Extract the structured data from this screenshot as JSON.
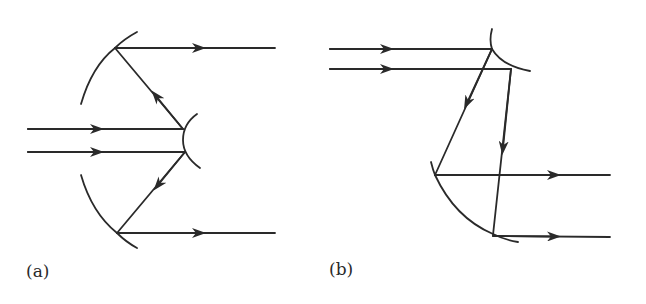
{
  "figure": {
    "stroke_color": "#2a2a2a",
    "background": "#ffffff"
  },
  "panels": [
    {
      "id": "a",
      "label": "(a)",
      "components": [
        "large-concave-mirror-upper",
        "large-concave-mirror-lower",
        "small-convex-mirror",
        "incoming-ray-1",
        "incoming-ray-2",
        "reflected-ray-upper",
        "reflected-ray-lower",
        "outgoing-ray-upper",
        "outgoing-ray-lower"
      ]
    },
    {
      "id": "b",
      "label": "(b)",
      "components": [
        "small-convex-mirror",
        "large-concave-mirror",
        "incoming-ray-1",
        "incoming-ray-2",
        "reflected-ray-1",
        "reflected-ray-2",
        "outgoing-ray-1",
        "outgoing-ray-2"
      ]
    }
  ]
}
